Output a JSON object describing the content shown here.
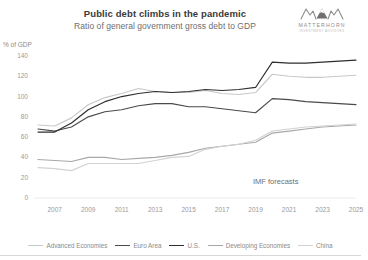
{
  "header": {
    "title": "Public debt climbs in the pandemic",
    "subtitle": "Ratio of general government gross debt to GDP"
  },
  "logo": {
    "mark": "matterhorn-mountain-mark",
    "name": "MATTERHORN",
    "tagline": "INVESTMENT ADVISORS"
  },
  "axis_unit_label": "% of GDP",
  "annotation": "IMF forecasts",
  "legend": {
    "items": [
      {
        "label": "Advanced Economies",
        "color": "#c8c8c8"
      },
      {
        "label": "Euro Area",
        "color": "#4a4a4a"
      },
      {
        "label": "U.S.",
        "color": "#2e2e2e"
      },
      {
        "label": "Developing Economies",
        "color": "#a8a8a8"
      },
      {
        "label": "China",
        "color": "#d2d2d2"
      }
    ]
  },
  "chart_data": {
    "type": "line",
    "title": "Public debt climbs in the pandemic",
    "subtitle": "Ratio of general government gross debt to GDP",
    "xlabel": "",
    "ylabel": "% of GDP",
    "ylim": [
      0,
      140
    ],
    "yticks": [
      0,
      20,
      40,
      60,
      80,
      100,
      120,
      140
    ],
    "xlim": [
      2006,
      2025
    ],
    "xticks": [
      2007,
      2009,
      2011,
      2013,
      2015,
      2017,
      2019,
      2021,
      2023,
      2025
    ],
    "grid": false,
    "legend_position": "bottom",
    "annotations": [
      {
        "text": "IMF forecasts",
        "x": 2022,
        "y": 18
      }
    ],
    "x": [
      2006,
      2007,
      2008,
      2009,
      2010,
      2011,
      2012,
      2013,
      2014,
      2015,
      2016,
      2017,
      2018,
      2019,
      2020,
      2021,
      2022,
      2023,
      2024,
      2025
    ],
    "series": [
      {
        "name": "Advanced Economies",
        "color": "#c8c8c8",
        "values": [
          72,
          71,
          79,
          92,
          99,
          103,
          108,
          105,
          104,
          104,
          106,
          103,
          102,
          104,
          122,
          120,
          119,
          119,
          120,
          121
        ]
      },
      {
        "name": "Euro Area",
        "color": "#4a4a4a",
        "values": [
          68,
          66,
          70,
          80,
          85,
          87,
          91,
          93,
          93,
          90,
          90,
          88,
          86,
          84,
          98,
          97,
          95,
          94,
          93,
          92
        ]
      },
      {
        "name": "U.S.",
        "color": "#2e2e2e",
        "values": [
          65,
          65,
          74,
          87,
          95,
          100,
          103,
          105,
          104,
          105,
          107,
          106,
          107,
          109,
          134,
          133,
          133,
          134,
          135,
          136
        ]
      },
      {
        "name": "Developing Economies",
        "color": "#a8a8a8",
        "values": [
          38,
          37,
          36,
          40,
          40,
          38,
          39,
          40,
          42,
          45,
          49,
          51,
          53,
          55,
          64,
          66,
          68,
          70,
          71,
          72
        ]
      },
      {
        "name": "China",
        "color": "#d2d2d2",
        "values": [
          30,
          29,
          27,
          34,
          34,
          34,
          34,
          37,
          40,
          41,
          48,
          51,
          53,
          57,
          66,
          68,
          70,
          71,
          72,
          73
        ]
      }
    ]
  }
}
